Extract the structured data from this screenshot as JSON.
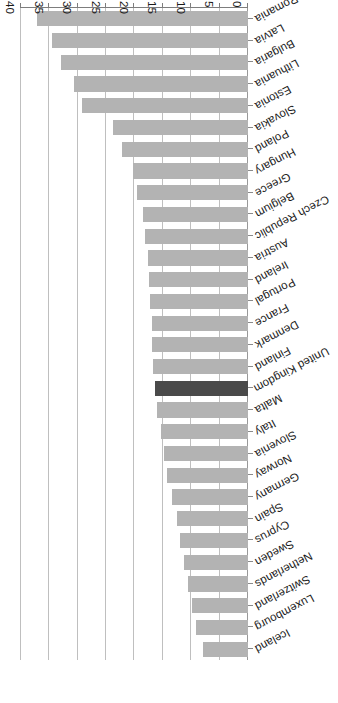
{
  "chart_data": {
    "type": "bar",
    "orientation": "horizontal",
    "title": "",
    "subtitle": "",
    "xlabel": "",
    "ylabel": "",
    "xlim": [
      0,
      40
    ],
    "grid": true,
    "legend": "none",
    "rotated_180": true,
    "tick_labels": [
      "40",
      "35",
      "30",
      "25",
      "20",
      "15",
      "10",
      "5",
      "0"
    ],
    "tick_values": [
      40,
      35,
      30,
      25,
      20,
      15,
      10,
      5,
      0
    ],
    "highlight_category": "United Kingdom",
    "highlight_color": "#4a4a4a",
    "bar_color": "#b3b3b3",
    "categories": [
      "Romania",
      "Latvia",
      "Bulgaria",
      "Lithuania",
      "Estonia",
      "Slovakia",
      "Poland",
      "Hungary",
      "Greece",
      "Belgium",
      "Czech Republic",
      "Austria",
      "Ireland",
      "Portugal",
      "France",
      "Denmark",
      "Finland",
      "United Kingdom",
      "Malta",
      "Italy",
      "Slovenia",
      "Norway",
      "Germany",
      "Spain",
      "Cyprus",
      "Sweden",
      "Netherlands",
      "Switzerland",
      "Luxembourg",
      "Iceland"
    ],
    "values": [
      37.2,
      34.5,
      32.9,
      30.6,
      29.2,
      23.8,
      22.2,
      20.2,
      19.5,
      18.5,
      18.1,
      17.7,
      17.4,
      17.2,
      17.0,
      16.9,
      16.7,
      16.4,
      16.0,
      15.3,
      14.8,
      14.3,
      13.4,
      12.5,
      12.0,
      11.2,
      10.6,
      9.8,
      9.1,
      7.9
    ]
  }
}
